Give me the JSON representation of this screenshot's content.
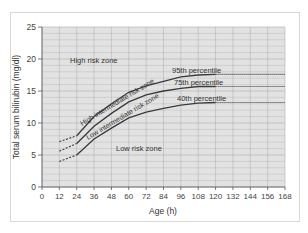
{
  "chart_data": {
    "type": "line",
    "title": "",
    "xlabel": "Age (h)",
    "ylabel": "Total serum bilirubin (mg/dl)",
    "xlim": [
      0,
      168
    ],
    "ylim": [
      0,
      25
    ],
    "x_ticks": [
      0,
      12,
      24,
      36,
      48,
      60,
      72,
      84,
      96,
      108,
      120,
      132,
      144,
      156,
      168
    ],
    "y_ticks": [
      0,
      5,
      10,
      15,
      20,
      25
    ],
    "grid": true,
    "legend": "none",
    "x": [
      12,
      24,
      36,
      48,
      60,
      72,
      84,
      96,
      108,
      120
    ],
    "series": [
      {
        "name": "95th percentile",
        "values": [
          7.1,
          8.0,
          11.0,
          13.0,
          14.8,
          15.8,
          16.5,
          17.2,
          17.5,
          17.6
        ],
        "extrapolated_to": 168
      },
      {
        "name": "75th percentile",
        "values": [
          5.6,
          6.8,
          9.5,
          11.5,
          13.3,
          14.4,
          15.0,
          15.4,
          15.7,
          15.7
        ],
        "extrapolated_to": 168
      },
      {
        "name": "40th percentile",
        "values": [
          4.0,
          5.0,
          7.5,
          9.2,
          10.8,
          11.7,
          12.3,
          12.8,
          13.1,
          13.2
        ],
        "extrapolated_to": 168
      }
    ],
    "annotations": [
      {
        "text": "High risk zone",
        "x": 29,
        "y": 19.5
      },
      {
        "text": "High intermediate risk zone",
        "x": 46,
        "y": 12.5,
        "rotation": -30
      },
      {
        "text": "Low intermediate risk zone",
        "x": 50,
        "y": 10.3,
        "rotation": -30
      },
      {
        "text": "Low risk zone",
        "x": 80,
        "y": 6.0
      },
      {
        "text": "95th percentile",
        "x": 108,
        "y": 18.2
      },
      {
        "text": "75th percentile",
        "x": 108,
        "y": 16.3
      },
      {
        "text": "40th percentile",
        "x": 110,
        "y": 13.8
      }
    ]
  },
  "labels": {
    "xlabel": "Age (h)",
    "ylabel": "Total serum bilirubin (mg/dl)",
    "high_risk": "High risk zone",
    "high_int": "High intermediate risk zone",
    "low_int": "Low intermediate risk zone",
    "low_risk": "Low risk zone",
    "p95": "95th percentile",
    "p75": "75th percentile",
    "p40": "40th percentile"
  },
  "colors": {
    "plot_bg": "#e2e2e2",
    "grid": "#b4b4b4",
    "curve": "#3a3a3a",
    "text": "#333333"
  }
}
